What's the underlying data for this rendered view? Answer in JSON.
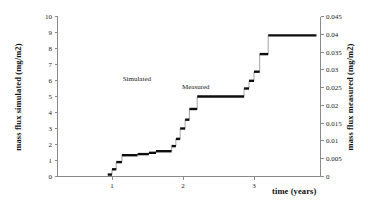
{
  "chart_data": {
    "type": "line",
    "title": "",
    "xlabel": "time (years)",
    "ylabel": "mass flux simulated (mg/m2)",
    "ylabel_right": "mass flux measured (mg/m2)",
    "xlim": [
      0.2,
      3.9
    ],
    "ylim": [
      0,
      10
    ],
    "ylim_right": [
      0,
      0.045
    ],
    "grid": false,
    "legend_position": "none",
    "xticks": [
      1,
      2,
      3
    ],
    "xtick_labels": [
      "1",
      "2",
      "3"
    ],
    "yticks_left": [
      0,
      1,
      2,
      3,
      4,
      5,
      6,
      7,
      8,
      9,
      10
    ],
    "ytick_labels_left": [
      "0",
      "1",
      "2",
      "3",
      "4",
      "5",
      "6",
      "7",
      "8",
      "9",
      "10"
    ],
    "yticks_right": [
      0,
      0.005,
      0.01,
      0.015,
      0.02,
      0.025,
      0.03,
      0.035,
      0.04,
      0.045
    ],
    "ytick_labels_right": [
      "0",
      "0.005",
      "0.01",
      "0.015",
      "0.02",
      "0.025",
      "0.03",
      "0.035",
      "0.04",
      "0.045"
    ],
    "annotations": [
      {
        "text": "Simulated",
        "x": 1.35,
        "y": 6.0
      },
      {
        "text": "Measured",
        "x": 2.18,
        "y": 5.45
      }
    ],
    "series": [
      {
        "name": "cumulative mass flux (step curve)",
        "style": "step-post",
        "color": "#0d0d0d",
        "steps": [
          {
            "x_start": 0.94,
            "x_end": 1.0,
            "y": 0.12
          },
          {
            "x_start": 1.0,
            "x_end": 1.06,
            "y": 0.45
          },
          {
            "x_start": 1.06,
            "x_end": 1.14,
            "y": 0.9
          },
          {
            "x_start": 1.14,
            "x_end": 1.36,
            "y": 1.33
          },
          {
            "x_start": 1.36,
            "x_end": 1.52,
            "y": 1.4
          },
          {
            "x_start": 1.52,
            "x_end": 1.62,
            "y": 1.48
          },
          {
            "x_start": 1.62,
            "x_end": 1.84,
            "y": 1.58
          },
          {
            "x_start": 1.84,
            "x_end": 1.9,
            "y": 1.9
          },
          {
            "x_start": 1.9,
            "x_end": 1.96,
            "y": 2.35
          },
          {
            "x_start": 1.96,
            "x_end": 2.03,
            "y": 3.0
          },
          {
            "x_start": 2.03,
            "x_end": 2.09,
            "y": 3.55
          },
          {
            "x_start": 2.09,
            "x_end": 2.2,
            "y": 4.22
          },
          {
            "x_start": 2.2,
            "x_end": 2.86,
            "y": 5.0
          },
          {
            "x_start": 2.86,
            "x_end": 2.93,
            "y": 5.5
          },
          {
            "x_start": 2.93,
            "x_end": 3.0,
            "y": 5.98
          },
          {
            "x_start": 3.0,
            "x_end": 3.08,
            "y": 6.55
          },
          {
            "x_start": 3.08,
            "x_end": 3.2,
            "y": 7.65
          },
          {
            "x_start": 3.2,
            "x_end": 3.88,
            "y": 8.82
          }
        ]
      }
    ]
  }
}
